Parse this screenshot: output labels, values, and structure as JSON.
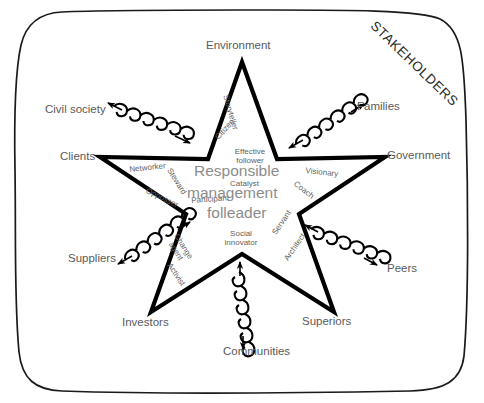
{
  "diagram": {
    "title": "STAKEHOLDERS",
    "frame": {
      "shape": "hand-drawn-rounded-rectangle",
      "stroke": "#1a1a1a"
    },
    "center_shape": {
      "shape": "five-pointed-star",
      "stroke": "#000000"
    },
    "colors": {
      "stroke": "#000000",
      "frame_stroke": "#1a1a1a",
      "stakeholder_text": "#5a5a5a",
      "role_text": "#5f5f5f",
      "core_text": "#8c8c8c",
      "title_text": "#2b2b2b"
    },
    "core": {
      "line1": "Responsible",
      "line2": "management",
      "line3": "folleader"
    },
    "stakeholders": [
      {
        "id": "environment",
        "label": "Environment",
        "connector": "none"
      },
      {
        "id": "civil-society",
        "label": "Civil society",
        "connector": "double-headed-spring-arrow"
      },
      {
        "id": "families",
        "label": "Families",
        "connector": "double-headed-spring-arrow"
      },
      {
        "id": "clients",
        "label": "Clients",
        "connector": "none"
      },
      {
        "id": "government",
        "label": "Government",
        "connector": "none"
      },
      {
        "id": "suppliers",
        "label": "Suppliers",
        "connector": "double-headed-spring-arrow"
      },
      {
        "id": "peers",
        "label": "Peers",
        "connector": "double-headed-spring-arrow"
      },
      {
        "id": "investors",
        "label": "Investors",
        "connector": "none"
      },
      {
        "id": "superiors",
        "label": "Superiors",
        "connector": "none"
      },
      {
        "id": "communities",
        "label": "Communities",
        "connector": "double-headed-spring-arrow"
      }
    ],
    "roles": [
      {
        "id": "storyteller",
        "label": "Storyteller"
      },
      {
        "id": "citizen",
        "label": "Citizen"
      },
      {
        "id": "effective-follower",
        "label": "Effective follower"
      },
      {
        "id": "networker",
        "label": "Networker"
      },
      {
        "id": "steward",
        "label": "Steward"
      },
      {
        "id": "opposer",
        "label": "Opposser"
      },
      {
        "id": "catalyst",
        "label": "Catalyst"
      },
      {
        "id": "participant",
        "label": "Participant"
      },
      {
        "id": "visionary",
        "label": "Visionary"
      },
      {
        "id": "coach",
        "label": "Coach"
      },
      {
        "id": "change-agent",
        "label": "Change agent"
      },
      {
        "id": "activist",
        "label": "Activist"
      },
      {
        "id": "social-innovator",
        "label": "Social innovator"
      },
      {
        "id": "servant",
        "label": "Servant"
      },
      {
        "id": "architect",
        "label": "Architect"
      }
    ]
  }
}
